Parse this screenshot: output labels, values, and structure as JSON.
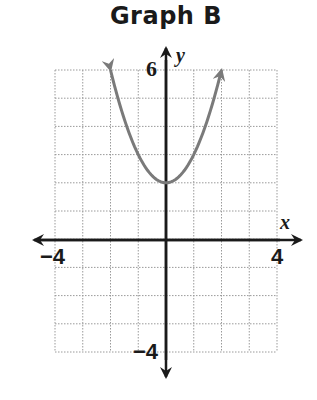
{
  "title": "Graph B",
  "axes": {
    "x_label": "x",
    "y_label": "y",
    "x_min_label": "−4",
    "x_max_label": "4",
    "y_max_label": "6",
    "y_min_label": "−4"
  },
  "colors": {
    "curve": "#7a7a7a",
    "axis": "#1a1a1a",
    "grid": "#9a9a9a"
  },
  "chart_data": {
    "type": "line",
    "title": "Graph B",
    "xlabel": "x",
    "ylabel": "y",
    "xlim": [
      -4,
      4
    ],
    "ylim": [
      -4,
      6
    ],
    "grid": true,
    "grid_step": 1,
    "tick_labels": {
      "x": [
        "−4",
        "4"
      ],
      "y": [
        "−4",
        "6"
      ]
    },
    "series": [
      {
        "name": "y = x^2 + 2",
        "equation": "y = x^2 + 2",
        "vertex": [
          0,
          2
        ],
        "x": [
          -2,
          -1.5,
          -1,
          -0.5,
          0,
          0.5,
          1,
          1.5,
          2
        ],
        "y": [
          6,
          4.25,
          3,
          2.25,
          2,
          2.25,
          3,
          4.25,
          6
        ],
        "arrows_at_ends": true
      }
    ]
  }
}
